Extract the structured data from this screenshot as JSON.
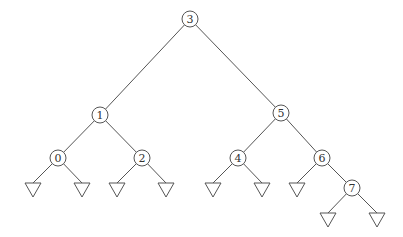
{
  "diagram": {
    "type": "binary-search-tree",
    "node_radius": 8,
    "colors": {
      "stroke": "#555555",
      "text": "#333333",
      "background": "#ffffff"
    },
    "nodes": [
      {
        "id": "n3",
        "label": "3",
        "x": 190,
        "y": 19
      },
      {
        "id": "n1",
        "label": "1",
        "x": 100,
        "y": 115
      },
      {
        "id": "n5",
        "label": "5",
        "x": 281,
        "y": 113
      },
      {
        "id": "n0",
        "label": "0",
        "x": 58,
        "y": 158
      },
      {
        "id": "n2",
        "label": "2",
        "x": 142,
        "y": 158
      },
      {
        "id": "n4",
        "label": "4",
        "x": 238,
        "y": 158
      },
      {
        "id": "n6",
        "label": "6",
        "x": 322,
        "y": 158
      },
      {
        "id": "n7",
        "label": "7",
        "x": 352,
        "y": 188
      }
    ],
    "leaves": [
      {
        "id": "l0a",
        "parent": "n0",
        "x": 33,
        "y": 183
      },
      {
        "id": "l0b",
        "parent": "n0",
        "x": 82,
        "y": 183
      },
      {
        "id": "l2a",
        "parent": "n2",
        "x": 117,
        "y": 183
      },
      {
        "id": "l2b",
        "parent": "n2",
        "x": 166,
        "y": 183
      },
      {
        "id": "l4a",
        "parent": "n4",
        "x": 213,
        "y": 183
      },
      {
        "id": "l4b",
        "parent": "n4",
        "x": 262,
        "y": 183
      },
      {
        "id": "l6a",
        "parent": "n6",
        "x": 297,
        "y": 183
      },
      {
        "id": "l7a",
        "parent": "n7",
        "x": 328,
        "y": 213
      },
      {
        "id": "l7b",
        "parent": "n7",
        "x": 377,
        "y": 213
      }
    ],
    "edges": [
      [
        "n3",
        "n1"
      ],
      [
        "n3",
        "n5"
      ],
      [
        "n1",
        "n0"
      ],
      [
        "n1",
        "n2"
      ],
      [
        "n5",
        "n4"
      ],
      [
        "n5",
        "n6"
      ],
      [
        "n6",
        "n7"
      ]
    ]
  }
}
